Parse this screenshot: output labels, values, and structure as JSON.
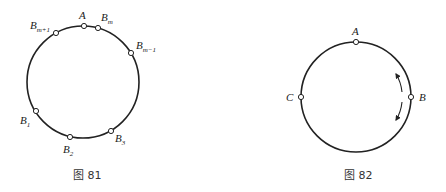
{
  "figures": [
    {
      "caption": "图 81",
      "circle": {
        "cx": 83,
        "cy": 82,
        "r": 56
      },
      "points": [
        {
          "name": "A",
          "base": "A",
          "sub": "",
          "x": 84,
          "y": 26,
          "lx": 79,
          "ly": 19
        },
        {
          "name": "B_m",
          "base": "B",
          "sub": "m",
          "x": 98,
          "y": 28,
          "lx": 101,
          "ly": 21
        },
        {
          "name": "B_m-1",
          "base": "B",
          "sub": "m−1",
          "x": 131,
          "y": 53,
          "lx": 136,
          "ly": 49
        },
        {
          "name": "B_m+1",
          "base": "B",
          "sub": "m+1",
          "x": 56,
          "y": 33,
          "lx": 30,
          "ly": 29
        },
        {
          "name": "B_1",
          "base": "B",
          "sub": "1",
          "x": 36,
          "y": 111,
          "lx": 20,
          "ly": 124
        },
        {
          "name": "B_2",
          "base": "B",
          "sub": "2",
          "x": 70,
          "y": 137,
          "lx": 63,
          "ly": 153
        },
        {
          "name": "B_3",
          "base": "B",
          "sub": "3",
          "x": 111,
          "y": 131,
          "lx": 115,
          "ly": 142
        }
      ]
    },
    {
      "caption": "图 82",
      "circle": {
        "cx": 356,
        "cy": 97,
        "r": 55
      },
      "points": [
        {
          "name": "A",
          "base": "A",
          "sub": "",
          "x": 356,
          "y": 42,
          "lx": 352,
          "ly": 35
        },
        {
          "name": "B",
          "base": "B",
          "sub": "",
          "x": 411,
          "y": 97,
          "lx": 419,
          "ly": 101
        },
        {
          "name": "C",
          "base": "C",
          "sub": "",
          "x": 301,
          "y": 97,
          "lx": 286,
          "ly": 101
        }
      ],
      "arrows": [
        "counterclockwise-up",
        "clockwise-down"
      ]
    }
  ]
}
